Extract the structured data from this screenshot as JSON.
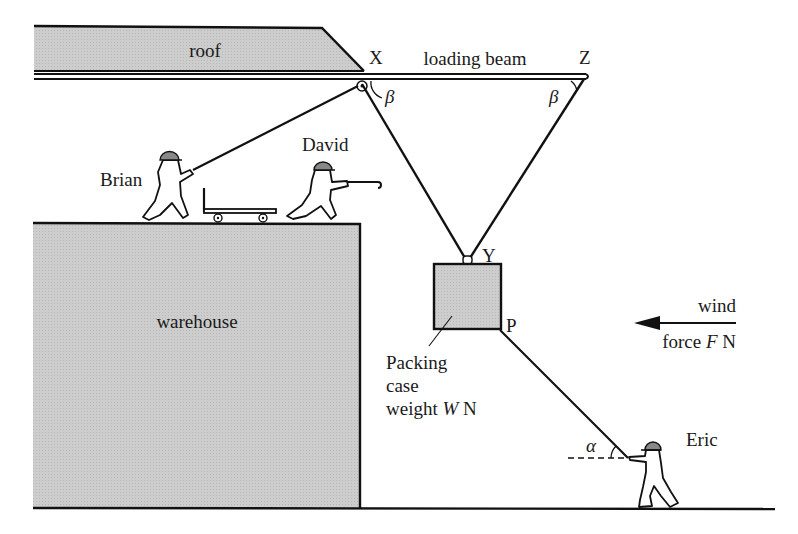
{
  "diagram": {
    "type": "mechanics-statics-scene",
    "labels": {
      "roof": "roof",
      "loading_beam": "loading beam",
      "point_x": "X",
      "point_z": "Z",
      "point_y": "Y",
      "point_p": "P",
      "warehouse": "warehouse",
      "brian": "Brian",
      "david": "David",
      "eric": "Eric",
      "case_line1": "Packing",
      "case_line2": "case",
      "case_line3_prefix": "weight ",
      "case_var": "W",
      "case_unit": " N",
      "wind_line1": "wind",
      "wind_line2_prefix": "force ",
      "wind_var": "F",
      "wind_unit": " N",
      "angle_beta_x": "β",
      "angle_beta_z": "β",
      "angle_alpha": "α"
    },
    "colors": {
      "ink": "#111111",
      "fill_grey": "#c8c8c8",
      "background": "#ffffff"
    }
  }
}
